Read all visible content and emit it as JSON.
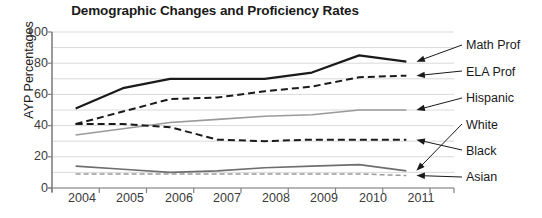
{
  "chart_data": {
    "type": "line",
    "title": "Demographic Changes and Proficiency Rates",
    "xlabel": "",
    "ylabel": "AYP Percentages",
    "categories": [
      "2004",
      "2005",
      "2006",
      "2007",
      "2008",
      "2009",
      "2010",
      "2011"
    ],
    "x": [
      2004,
      2005,
      2006,
      2007,
      2008,
      2009,
      2010,
      2011
    ],
    "ylim": [
      0,
      100
    ],
    "yticks": [
      0,
      20,
      40,
      60,
      80,
      100
    ],
    "minor_gridlines": [
      10,
      30,
      50,
      70,
      90
    ],
    "grid": true,
    "legend_position": "right-annotations",
    "series": [
      {
        "name": "Math Prof",
        "style": "solid",
        "color": "#1a1a1a",
        "width": 2.2,
        "values": [
          51,
          64,
          70,
          70,
          70,
          74,
          85,
          81
        ]
      },
      {
        "name": "ELA Prof",
        "style": "dashed",
        "color": "#1a1a1a",
        "width": 2.0,
        "values": [
          41,
          49,
          57,
          58,
          62,
          65,
          71,
          72
        ]
      },
      {
        "name": "Hispanic",
        "style": "solid",
        "color": "#9a9a9a",
        "width": 1.6,
        "values": [
          34,
          38,
          42,
          44,
          46,
          47,
          50,
          50
        ]
      },
      {
        "name": "White",
        "style": "solid",
        "color": "#6e6e6e",
        "width": 1.6,
        "values": [
          14,
          12,
          10,
          11,
          13,
          14,
          15,
          11
        ]
      },
      {
        "name": "Black",
        "style": "dashed",
        "color": "#1a1a1a",
        "width": 2.0,
        "values": [
          41,
          41,
          39,
          31,
          30,
          31,
          31,
          31
        ]
      },
      {
        "name": "Asian",
        "style": "dashed",
        "color": "#9a9a9a",
        "width": 1.5,
        "values": [
          9,
          9,
          9,
          9,
          9,
          9,
          9,
          8
        ]
      }
    ],
    "annotations": [
      {
        "label": "Math Prof",
        "points_to_series": "Math Prof",
        "points_to_x": 2011
      },
      {
        "label": "ELA Prof",
        "points_to_series": "ELA Prof",
        "points_to_x": 2011
      },
      {
        "label": "Hispanic",
        "points_to_series": "Hispanic",
        "points_to_x": 2011
      },
      {
        "label": "White",
        "points_to_series": "White",
        "points_to_x": 2011
      },
      {
        "label": "Black",
        "points_to_series": "Black",
        "points_to_x": 2011
      },
      {
        "label": "Asian",
        "points_to_series": "Asian",
        "points_to_x": 2011
      }
    ]
  },
  "axis": {
    "y_tick_labels": [
      "100",
      "80",
      "60",
      "40",
      "20",
      "0"
    ],
    "x_tick_labels": [
      "2004",
      "2005",
      "2006",
      "2007",
      "2008",
      "2009",
      "2010",
      "2011"
    ],
    "y_title": "AYP Percentages"
  },
  "colors": {
    "grid": "#d9d9d9",
    "axis": "#808080",
    "dark_series": "#1a1a1a",
    "mid_series": "#6e6e6e",
    "light_series": "#9a9a9a",
    "text": "#1a1a1a",
    "background": "#ffffff"
  }
}
